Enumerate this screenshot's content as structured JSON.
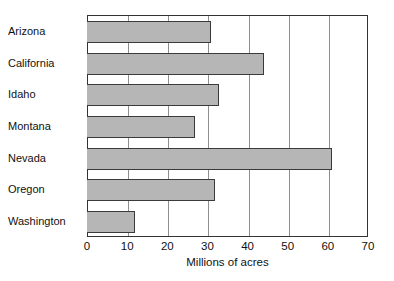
{
  "chart_data": {
    "type": "bar",
    "orientation": "horizontal",
    "title": "",
    "xlabel": "Millions of acres",
    "ylabel": "",
    "categories": [
      "Arizona",
      "California",
      "Idaho",
      "Montana",
      "Nevada",
      "Oregon",
      "Washington"
    ],
    "values": [
      31,
      44,
      33,
      27,
      61,
      32,
      12
    ],
    "xlim": [
      0,
      70
    ],
    "xticks": [
      0,
      10,
      20,
      30,
      40,
      50,
      60,
      70
    ],
    "xtick_labels": [
      "0",
      "10",
      "20",
      "30",
      "40",
      "50",
      "60",
      "70"
    ],
    "grid": "vertical gridlines at every x tick",
    "legend": "none",
    "bar_fill_color": "#b6b6b6",
    "bar_edge_color": "#3a3a3a",
    "frame_color": "#333333",
    "gridline_color": "#8e8e8e",
    "background_color": "#ffffff"
  },
  "axis": {
    "x_title": "Millions of acres"
  }
}
